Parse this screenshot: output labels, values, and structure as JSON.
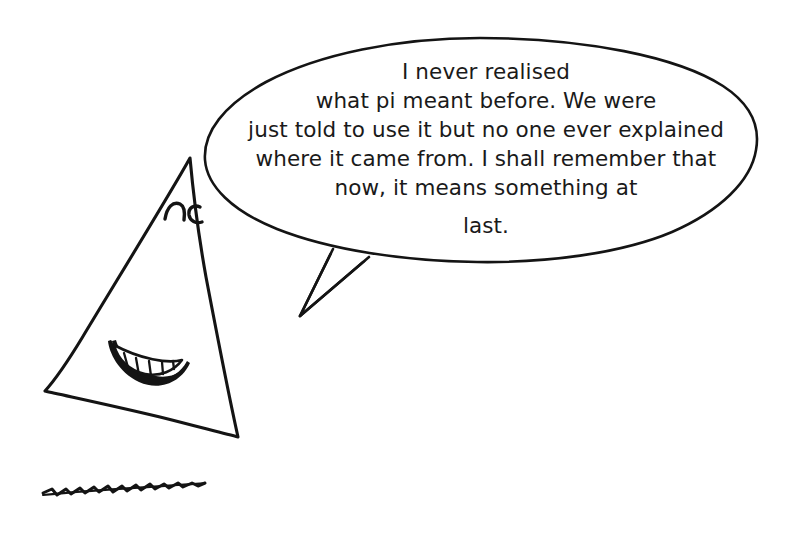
{
  "scene": {
    "title": "Talking Triangle Cartoon",
    "background_color": "#ffffff",
    "ink_color": "#141414",
    "width": 786,
    "height": 534
  },
  "character": {
    "name": "triangle-character",
    "shape": "triangle",
    "expression": "happy",
    "eyes": "closed-arched-eyes",
    "mouth": "wide-grin-with-teeth",
    "teeth_count": 5
  },
  "ground": {
    "name": "squiggly-ground-line",
    "style": "hand-drawn-zigzag"
  },
  "speech_bubble": {
    "shape": "ellipse",
    "tail_direction": "down-left",
    "lines": [
      "I never realised",
      "what pi meant before. We were",
      "just told to use it but no one ever explained",
      "where it came from. I shall remember that",
      "now, it means something at",
      "last."
    ],
    "full_text": "I never realised what pi meant before. We were just told to use it but no one ever explained where it came from. I shall remember that now, it means something at last."
  }
}
